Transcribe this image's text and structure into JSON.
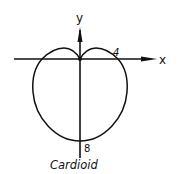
{
  "figure": {
    "caption": "Cardioid",
    "axes": {
      "x_label": "x",
      "y_label": "y"
    },
    "annotations": [
      {
        "text": "4",
        "meaning": "x-intercept on positive x-axis"
      },
      {
        "text": "8",
        "meaning": "intercept on negative y-axis"
      }
    ],
    "colors": {
      "stroke": "#111111",
      "background": "#ffffff"
    }
  }
}
